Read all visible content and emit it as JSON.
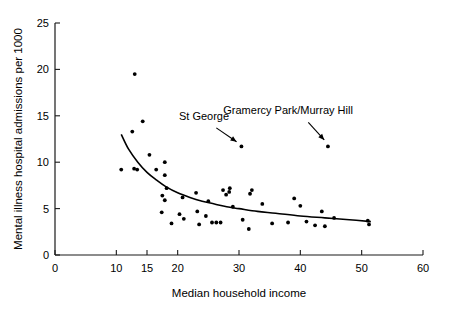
{
  "chart_data": {
    "type": "scatter",
    "title": "",
    "xlabel": "Median household income",
    "ylabel": "Mental illness hospital admissions per 1000",
    "xlim": [
      0,
      60
    ],
    "ylim": [
      0,
      25
    ],
    "grid": false,
    "legend": null,
    "xticks": [
      0,
      10,
      15,
      20,
      30,
      40,
      50,
      60
    ],
    "xticklabels": [
      "0",
      "10",
      "15",
      "20",
      "30",
      "40",
      "50",
      "60"
    ],
    "yticks": [
      0,
      5,
      10,
      15,
      20,
      25
    ],
    "yticklabels": [
      "0",
      "5",
      "10",
      "15",
      "20",
      "25"
    ],
    "points": [
      {
        "x": 10.8,
        "y": 9.2
      },
      {
        "x": 12.6,
        "y": 13.3
      },
      {
        "x": 13.0,
        "y": 19.5
      },
      {
        "x": 12.9,
        "y": 9.3
      },
      {
        "x": 13.4,
        "y": 9.2
      },
      {
        "x": 14.3,
        "y": 14.4
      },
      {
        "x": 15.4,
        "y": 10.8
      },
      {
        "x": 16.5,
        "y": 9.2
      },
      {
        "x": 17.4,
        "y": 4.6
      },
      {
        "x": 17.9,
        "y": 10.0
      },
      {
        "x": 17.9,
        "y": 8.6
      },
      {
        "x": 17.9,
        "y": 5.9
      },
      {
        "x": 17.5,
        "y": 6.4
      },
      {
        "x": 18.2,
        "y": 7.2
      },
      {
        "x": 19.0,
        "y": 3.4
      },
      {
        "x": 20.3,
        "y": 4.4
      },
      {
        "x": 20.8,
        "y": 6.2
      },
      {
        "x": 21.0,
        "y": 3.9
      },
      {
        "x": 23.0,
        "y": 6.7
      },
      {
        "x": 23.2,
        "y": 4.7
      },
      {
        "x": 23.5,
        "y": 3.3
      },
      {
        "x": 24.6,
        "y": 4.2
      },
      {
        "x": 25.0,
        "y": 5.8
      },
      {
        "x": 25.6,
        "y": 3.5
      },
      {
        "x": 26.3,
        "y": 3.5
      },
      {
        "x": 27.0,
        "y": 3.5
      },
      {
        "x": 27.4,
        "y": 7.0
      },
      {
        "x": 27.9,
        "y": 6.5
      },
      {
        "x": 28.5,
        "y": 7.2
      },
      {
        "x": 28.4,
        "y": 6.8
      },
      {
        "x": 29.0,
        "y": 5.2
      },
      {
        "x": 30.4,
        "y": 11.7,
        "label": "St George"
      },
      {
        "x": 30.6,
        "y": 3.8
      },
      {
        "x": 31.6,
        "y": 2.8
      },
      {
        "x": 31.8,
        "y": 6.6
      },
      {
        "x": 32.1,
        "y": 7.0
      },
      {
        "x": 33.8,
        "y": 5.5
      },
      {
        "x": 35.4,
        "y": 3.4
      },
      {
        "x": 38.0,
        "y": 3.5
      },
      {
        "x": 39.0,
        "y": 6.1
      },
      {
        "x": 40.0,
        "y": 5.3
      },
      {
        "x": 41.0,
        "y": 3.6
      },
      {
        "x": 42.4,
        "y": 3.2
      },
      {
        "x": 43.5,
        "y": 4.7
      },
      {
        "x": 44.0,
        "y": 3.1
      },
      {
        "x": 44.5,
        "y": 11.7,
        "label": "Gramercy Park/Murray Hill"
      },
      {
        "x": 45.5,
        "y": 4.0
      },
      {
        "x": 51.0,
        "y": 3.7
      },
      {
        "x": 51.2,
        "y": 3.3
      }
    ],
    "trend_curve": {
      "description": "fitted decreasing power/exponential trend line",
      "points": [
        {
          "x": 10.8,
          "y": 13.0
        },
        {
          "x": 12.0,
          "y": 11.4
        },
        {
          "x": 13.5,
          "y": 10.0
        },
        {
          "x": 15.0,
          "y": 8.9
        },
        {
          "x": 16.5,
          "y": 8.1
        },
        {
          "x": 18.0,
          "y": 7.4
        },
        {
          "x": 20.0,
          "y": 6.7
        },
        {
          "x": 22.0,
          "y": 6.2
        },
        {
          "x": 24.0,
          "y": 5.8
        },
        {
          "x": 26.0,
          "y": 5.5
        },
        {
          "x": 28.0,
          "y": 5.2
        },
        {
          "x": 30.0,
          "y": 5.0
        },
        {
          "x": 33.0,
          "y": 4.7
        },
        {
          "x": 36.0,
          "y": 4.5
        },
        {
          "x": 40.0,
          "y": 4.2
        },
        {
          "x": 44.0,
          "y": 4.0
        },
        {
          "x": 48.0,
          "y": 3.8
        },
        {
          "x": 51.5,
          "y": 3.6
        }
      ]
    },
    "annotations": [
      {
        "text": "St George",
        "text_x": 24.3,
        "text_y": 14.6,
        "arrow_from_x": 26.3,
        "arrow_from_y": 13.7,
        "arrow_to_x": 29.6,
        "arrow_to_y": 12.2
      },
      {
        "text": "Gramercy Park/Murray Hill",
        "text_x": 38.0,
        "text_y": 15.2,
        "arrow_from_x": 41.3,
        "arrow_from_y": 14.3,
        "arrow_to_x": 43.9,
        "arrow_to_y": 12.4
      }
    ]
  },
  "colors": {
    "point": "#000000",
    "curve": "#000000",
    "axis": "#1a1a1a",
    "background": "#ffffff"
  }
}
